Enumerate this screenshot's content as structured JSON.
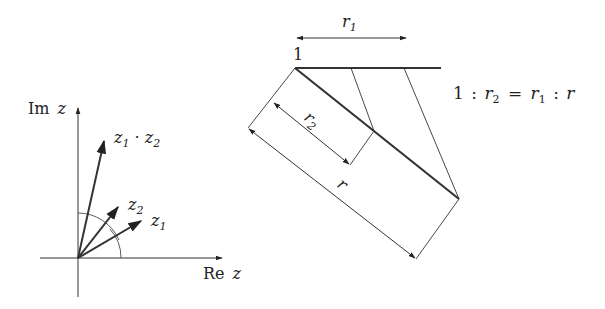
{
  "left_diagram": {
    "axis_y_label": "Im",
    "axis_x_label": "Re",
    "axis_var": "z",
    "vectors": [
      {
        "name": "z",
        "sub": "1",
        "label_suffix": " · z",
        "label_suffix_sub": "2",
        "id": "product"
      },
      {
        "name": "z",
        "sub": "2",
        "id": "z2"
      },
      {
        "name": "z",
        "sub": "1",
        "id": "z1"
      }
    ]
  },
  "right_diagram": {
    "r1_label": "r",
    "r1_sub": "1",
    "unit_label": "1",
    "r2_label": "r",
    "r2_sub": "2",
    "r_label": "r",
    "equation": {
      "one": "1",
      "colon": ":",
      "r2": "r",
      "r2_sub": "2",
      "eq": "=",
      "r1": "r",
      "r1_sub": "1",
      "r": "r"
    }
  },
  "colors": {
    "ink": "#222222",
    "background": "#ffffff"
  }
}
